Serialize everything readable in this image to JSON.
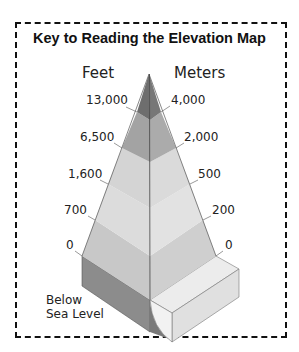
{
  "title": "Key to Reading the Elevation Map",
  "columns": {
    "left": "Feet",
    "right": "Meters"
  },
  "levels": [
    {
      "feet": "13,000",
      "meters": "4,000",
      "color": "#6e6e6e"
    },
    {
      "feet": "6,500",
      "meters": "2,000",
      "color": "#a3a3a3"
    },
    {
      "feet": "1,600",
      "meters": "500",
      "color": "#d4d4d4"
    },
    {
      "feet": "700",
      "meters": "200",
      "color": "#dcdcdc"
    },
    {
      "feet": "0",
      "meters": "0",
      "color": "#c8c8c8"
    }
  ],
  "below_sea_level": {
    "line1": "Below",
    "line2": "Sea Level",
    "color": "#8c8c8c"
  },
  "slab_color": "#e6e6e6"
}
